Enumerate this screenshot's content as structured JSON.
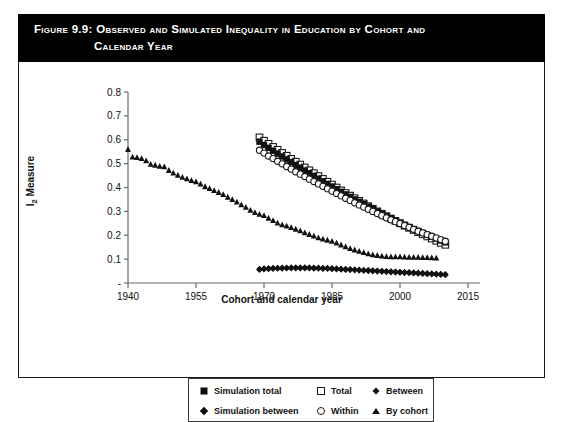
{
  "figure": {
    "label": "Figure 9.9:",
    "title_line1": "Observed and Simulated Inequality in Education by Cohort and",
    "title_line2": "Calendar Year",
    "banner_color": "#000000",
    "banner_text_color": "#ffffff",
    "frame_color": "#1a1a1a"
  },
  "legend": {
    "position": "below-axis",
    "rows": [
      [
        {
          "label": "Simulation total",
          "marker": "filled-square-icon"
        },
        {
          "label": "Total",
          "marker": "open-square-icon"
        },
        {
          "label": "Between",
          "marker": "small-filled-diamond-icon"
        }
      ],
      [
        {
          "label": "Simulation between",
          "marker": "filled-diamond-icon"
        },
        {
          "label": "Within",
          "marker": "open-circle-icon"
        },
        {
          "label": "By cohort",
          "marker": "small-triangle-icon"
        }
      ]
    ]
  },
  "chart_data": {
    "type": "scatter",
    "title": "Observed and Simulated Inequality in Education by Cohort and Calendar Year",
    "xlabel": "Cohort and calendar year",
    "ylabel": "I2 Measure",
    "xlim": [
      1940,
      2015
    ],
    "ylim": [
      0,
      0.8
    ],
    "xticks": [
      1940,
      1955,
      1970,
      1985,
      2000,
      2015
    ],
    "yticks": [
      0,
      0.1,
      0.2,
      0.3,
      0.4,
      0.5,
      0.6,
      0.7,
      0.8
    ],
    "ytick_labels": [
      "-",
      "0.1",
      "0.2",
      "0.3",
      "0.4",
      "0.5",
      "0.6",
      "0.7",
      "0.8"
    ],
    "grid": false,
    "legend_position": "bottom",
    "series": [
      {
        "name": "By cohort",
        "marker": "small-triangle-icon",
        "fill": "#111111",
        "x": [
          1940,
          1941,
          1942,
          1943,
          1944,
          1945,
          1946,
          1947,
          1948,
          1949,
          1950,
          1951,
          1952,
          1953,
          1954,
          1955,
          1956,
          1957,
          1958,
          1959,
          1960,
          1961,
          1962,
          1963,
          1964,
          1965,
          1966,
          1967,
          1968,
          1969,
          1970,
          1971,
          1972,
          1973,
          1974,
          1975,
          1976,
          1977,
          1978,
          1979,
          1980,
          1981,
          1982,
          1983,
          1984,
          1985,
          1986,
          1987,
          1988,
          1989,
          1990,
          1991,
          1992,
          1993,
          1994,
          1995,
          1996,
          1997,
          1998,
          1999,
          2000,
          2001,
          2002,
          2003,
          2004,
          2005,
          2006,
          2007,
          2008
        ],
        "y": [
          0.56,
          0.528,
          0.526,
          0.522,
          0.512,
          0.498,
          0.494,
          0.489,
          0.487,
          0.472,
          0.461,
          0.452,
          0.443,
          0.437,
          0.43,
          0.424,
          0.415,
          0.404,
          0.396,
          0.388,
          0.38,
          0.371,
          0.36,
          0.35,
          0.34,
          0.328,
          0.318,
          0.305,
          0.296,
          0.288,
          0.283,
          0.272,
          0.262,
          0.252,
          0.244,
          0.239,
          0.233,
          0.226,
          0.219,
          0.211,
          0.204,
          0.197,
          0.19,
          0.185,
          0.18,
          0.175,
          0.168,
          0.16,
          0.152,
          0.145,
          0.139,
          0.133,
          0.128,
          0.123,
          0.119,
          0.116,
          0.113,
          0.111,
          0.11,
          0.11,
          0.11,
          0.109,
          0.108,
          0.108,
          0.108,
          0.107,
          0.107,
          0.106,
          0.105
        ]
      },
      {
        "name": "Total",
        "marker": "open-square-icon",
        "fill": "#ffffff",
        "x": [
          1969,
          1970,
          1971,
          1972,
          1973,
          1974,
          1975,
          1976,
          1977,
          1978,
          1979,
          1980,
          1981,
          1982,
          1983,
          1984,
          1985,
          1986,
          1987,
          1988,
          1989,
          1990,
          1991,
          1992,
          1993,
          1994,
          1995,
          1996,
          1997,
          1998,
          1999,
          2000,
          2001,
          2002,
          2003,
          2004,
          2005,
          2006,
          2007,
          2008,
          2009,
          2010
        ],
        "y": [
          0.61,
          0.596,
          0.583,
          0.57,
          0.558,
          0.545,
          0.533,
          0.52,
          0.508,
          0.496,
          0.484,
          0.472,
          0.46,
          0.448,
          0.436,
          0.424,
          0.412,
          0.4,
          0.388,
          0.377,
          0.366,
          0.355,
          0.344,
          0.333,
          0.322,
          0.311,
          0.3,
          0.29,
          0.28,
          0.27,
          0.26,
          0.25,
          0.24,
          0.231,
          0.222,
          0.213,
          0.204,
          0.195,
          0.186,
          0.177,
          0.168,
          0.16
        ]
      },
      {
        "name": "Simulation total",
        "marker": "filled-square-icon",
        "fill": "#111111",
        "x": [
          1969,
          1970,
          1971,
          1972,
          1973,
          1974,
          1975,
          1976,
          1977,
          1978,
          1979,
          1980,
          1981,
          1982,
          1983,
          1984,
          1985,
          1986,
          1987,
          1988,
          1989,
          1990,
          1991,
          1992,
          1993,
          1994,
          1995,
          1996,
          1997,
          1998,
          1999,
          2000,
          2001,
          2002,
          2003,
          2004,
          2005,
          2006,
          2007,
          2008,
          2009,
          2010
        ],
        "y": [
          0.592,
          0.578,
          0.566,
          0.554,
          0.542,
          0.53,
          0.518,
          0.506,
          0.494,
          0.483,
          0.471,
          0.46,
          0.448,
          0.437,
          0.426,
          0.415,
          0.404,
          0.393,
          0.382,
          0.371,
          0.361,
          0.35,
          0.34,
          0.33,
          0.32,
          0.31,
          0.3,
          0.29,
          0.28,
          0.271,
          0.262,
          0.253,
          0.244,
          0.235,
          0.226,
          0.218,
          0.21,
          0.202,
          0.194,
          0.186,
          0.178,
          0.17
        ]
      },
      {
        "name": "Within",
        "marker": "open-circle-icon",
        "fill": "#ffffff",
        "x": [
          1969,
          1970,
          1971,
          1972,
          1973,
          1974,
          1975,
          1976,
          1977,
          1978,
          1979,
          1980,
          1981,
          1982,
          1983,
          1984,
          1985,
          1986,
          1987,
          1988,
          1989,
          1990,
          1991,
          1992,
          1993,
          1994,
          1995,
          1996,
          1997,
          1998,
          1999,
          2000,
          2001,
          2002,
          2003,
          2004,
          2005,
          2006,
          2007,
          2008,
          2009,
          2010
        ],
        "y": [
          0.556,
          0.544,
          0.532,
          0.521,
          0.51,
          0.499,
          0.488,
          0.477,
          0.466,
          0.456,
          0.446,
          0.435,
          0.425,
          0.415,
          0.405,
          0.395,
          0.385,
          0.375,
          0.365,
          0.355,
          0.346,
          0.336,
          0.327,
          0.318,
          0.309,
          0.3,
          0.291,
          0.282,
          0.273,
          0.265,
          0.257,
          0.249,
          0.241,
          0.233,
          0.225,
          0.217,
          0.21,
          0.203,
          0.196,
          0.189,
          0.182,
          0.175
        ]
      },
      {
        "name": "Between",
        "marker": "small-filled-diamond-icon",
        "fill": "#111111",
        "x": [
          1969,
          1970,
          1971,
          1972,
          1973,
          1974,
          1975,
          1976,
          1977,
          1978,
          1979,
          1980,
          1981,
          1982,
          1983,
          1984,
          1985,
          1986,
          1987,
          1988,
          1989,
          1990,
          1991,
          1992,
          1993,
          1994,
          1995,
          1996,
          1997,
          1998,
          1999,
          2000,
          2001,
          2002,
          2003,
          2004,
          2005,
          2006,
          2007,
          2008,
          2009,
          2010
        ],
        "y": [
          0.06,
          0.062,
          0.063,
          0.064,
          0.064,
          0.065,
          0.065,
          0.066,
          0.066,
          0.066,
          0.066,
          0.066,
          0.065,
          0.065,
          0.064,
          0.064,
          0.063,
          0.062,
          0.061,
          0.06,
          0.059,
          0.058,
          0.057,
          0.056,
          0.055,
          0.054,
          0.053,
          0.052,
          0.051,
          0.05,
          0.049,
          0.048,
          0.047,
          0.046,
          0.045,
          0.044,
          0.043,
          0.042,
          0.041,
          0.04,
          0.039,
          0.038
        ]
      },
      {
        "name": "Simulation between",
        "marker": "filled-diamond-icon",
        "fill": "#111111",
        "x": [
          1969,
          1970,
          1971,
          1972,
          1973,
          1974,
          1975,
          1976,
          1977,
          1978,
          1979,
          1980,
          1981,
          1982,
          1983,
          1984,
          1985,
          1986,
          1987,
          1988,
          1989,
          1990,
          1991,
          1992,
          1993,
          1994,
          1995,
          1996,
          1997,
          1998,
          1999,
          2000,
          2001,
          2002,
          2003,
          2004,
          2005,
          2006,
          2007,
          2008,
          2009,
          2010
        ],
        "y": [
          0.056,
          0.058,
          0.059,
          0.06,
          0.061,
          0.061,
          0.062,
          0.062,
          0.062,
          0.062,
          0.062,
          0.062,
          0.061,
          0.061,
          0.06,
          0.06,
          0.059,
          0.058,
          0.057,
          0.056,
          0.055,
          0.054,
          0.053,
          0.052,
          0.051,
          0.05,
          0.049,
          0.048,
          0.047,
          0.046,
          0.045,
          0.044,
          0.043,
          0.042,
          0.041,
          0.04,
          0.039,
          0.038,
          0.037,
          0.036,
          0.035,
          0.034
        ]
      }
    ]
  }
}
